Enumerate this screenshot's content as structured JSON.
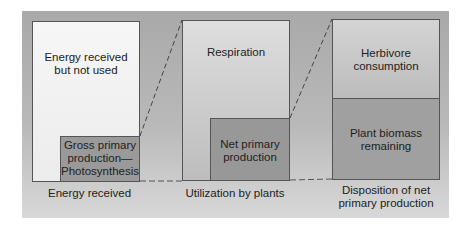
{
  "diagram": {
    "type": "energy-flow-bars",
    "columns": [
      {
        "caption": "Energy received",
        "outer_label_line1": "Energy received",
        "outer_label_line2": "but not used",
        "inner_label_line1": "Gross primary",
        "inner_label_line2": "production—",
        "inner_label_line3": "Photosynthesis"
      },
      {
        "caption": "Utilization by plants",
        "outer_label": "Respiration",
        "inner_label_line1": "Net primary",
        "inner_label_line2": "production"
      },
      {
        "caption_line1": "Disposition of net",
        "caption_line2": "primary production",
        "top_label_line1": "Herbivore",
        "top_label_line2": "consumption",
        "bottom_label_line1": "Plant biomass",
        "bottom_label_line2": "remaining"
      }
    ],
    "colors": {
      "panel_top": "#a9a9a9",
      "panel_bottom": "#d8d8d8",
      "box1_outer": "#f2f2f2",
      "box1_inner": "#9a9a9a",
      "box2_outer": "#c8c8c8",
      "box2_inner": "#989898",
      "box3_top": "#bebebe",
      "box3_bottom": "#a0a0a0",
      "border": "#555555"
    }
  }
}
